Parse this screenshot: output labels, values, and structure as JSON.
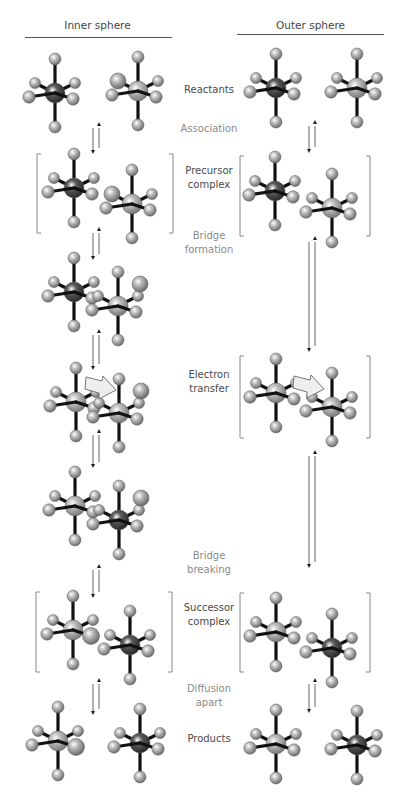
{
  "headers": {
    "inner": "Inner sphere",
    "outer": "Outer sphere"
  },
  "labels": [
    {
      "id": "reactants",
      "text": "Reactants",
      "kind": "stage",
      "x": 164,
      "y": 90
    },
    {
      "id": "association",
      "text": "Association",
      "kind": "step",
      "x": 164,
      "y": 129
    },
    {
      "id": "precursor",
      "text": "Precursor\ncomplex",
      "kind": "stage",
      "x": 164,
      "y": 178
    },
    {
      "id": "bridge-formation",
      "text": "Bridge\nformation",
      "kind": "step",
      "x": 164,
      "y": 243
    },
    {
      "id": "electron-transfer",
      "text": "Electron\ntransfer",
      "kind": "stage",
      "x": 164,
      "y": 382
    },
    {
      "id": "bridge-breaking",
      "text": "Bridge\nbreaking",
      "kind": "step",
      "x": 164,
      "y": 563
    },
    {
      "id": "successor",
      "text": "Successor\ncomplex",
      "kind": "stage",
      "x": 164,
      "y": 615
    },
    {
      "id": "diffusion-apart",
      "text": "Diffusion\napart",
      "kind": "step",
      "x": 164,
      "y": 696
    },
    {
      "id": "products",
      "text": "Products",
      "kind": "stage",
      "x": 164,
      "y": 739
    }
  ],
  "colors": {
    "bond": "#111111",
    "ligand": "#b0b0b0",
    "metal_light": "#b8b8b8",
    "metal_dark": "#4a4a4a",
    "bracket": "#888888",
    "arrow": "#555555",
    "et_arrow_fill": "#eeeeee",
    "et_arrow_stroke": "#666666"
  },
  "complexes": [
    {
      "col": "inner",
      "stage": "reactants",
      "cx": 55,
      "cy": 93,
      "metal": "dark"
    },
    {
      "col": "inner",
      "stage": "reactants",
      "cx": 138,
      "cy": 91,
      "metal": "light",
      "bridge": "left"
    },
    {
      "col": "outer",
      "stage": "reactants",
      "cx": 276,
      "cy": 88,
      "metal": "dark"
    },
    {
      "col": "outer",
      "stage": "reactants",
      "cx": 357,
      "cy": 88,
      "metal": "light"
    },
    {
      "col": "inner",
      "stage": "precursor",
      "cx": 74,
      "cy": 188,
      "metal": "dark"
    },
    {
      "col": "inner",
      "stage": "precursor",
      "cx": 132,
      "cy": 204,
      "metal": "light",
      "bridge": "left"
    },
    {
      "col": "outer",
      "stage": "precursor",
      "cx": 275,
      "cy": 191,
      "metal": "dark"
    },
    {
      "col": "outer",
      "stage": "precursor",
      "cx": 332,
      "cy": 208,
      "metal": "light"
    },
    {
      "col": "inner",
      "stage": "bridge",
      "cx": 74,
      "cy": 292,
      "metal": "dark"
    },
    {
      "col": "inner",
      "stage": "bridge",
      "cx": 118,
      "cy": 306,
      "metal": "light",
      "bridge": "upper"
    },
    {
      "col": "inner",
      "stage": "et",
      "cx": 76,
      "cy": 402,
      "metal": "light"
    },
    {
      "col": "inner",
      "stage": "et",
      "cx": 119,
      "cy": 413,
      "metal": "light",
      "bridge": "upper"
    },
    {
      "col": "outer",
      "stage": "et",
      "cx": 276,
      "cy": 393,
      "metal": "light"
    },
    {
      "col": "outer",
      "stage": "et",
      "cx": 332,
      "cy": 407,
      "metal": "light"
    },
    {
      "col": "inner",
      "stage": "post",
      "cx": 75,
      "cy": 506,
      "metal": "light"
    },
    {
      "col": "inner",
      "stage": "post",
      "cx": 119,
      "cy": 520,
      "metal": "dark",
      "bridge": "upper"
    },
    {
      "col": "inner",
      "stage": "successor",
      "cx": 73,
      "cy": 630,
      "metal": "light",
      "bridge": "right"
    },
    {
      "col": "inner",
      "stage": "successor",
      "cx": 130,
      "cy": 645,
      "metal": "dark"
    },
    {
      "col": "outer",
      "stage": "successor",
      "cx": 276,
      "cy": 632,
      "metal": "light"
    },
    {
      "col": "outer",
      "stage": "successor",
      "cx": 332,
      "cy": 648,
      "metal": "dark"
    },
    {
      "col": "inner",
      "stage": "products",
      "cx": 58,
      "cy": 741,
      "metal": "light",
      "bridge": "right"
    },
    {
      "col": "inner",
      "stage": "products",
      "cx": 140,
      "cy": 743,
      "metal": "dark"
    },
    {
      "col": "outer",
      "stage": "products",
      "cx": 276,
      "cy": 744,
      "metal": "light"
    },
    {
      "col": "outer",
      "stage": "products",
      "cx": 357,
      "cy": 745,
      "metal": "dark"
    }
  ],
  "brackets": [
    {
      "stage": "precursor",
      "x1": 37,
      "x2": 173,
      "y1": 154,
      "y2": 233
    },
    {
      "stage": "precursor",
      "x1": 240,
      "x2": 370,
      "y1": 156,
      "y2": 236
    },
    {
      "stage": "et",
      "x1": 240,
      "x2": 370,
      "y1": 356,
      "y2": 438
    },
    {
      "stage": "successor",
      "x1": 36,
      "x2": 172,
      "y1": 592,
      "y2": 672
    },
    {
      "stage": "successor",
      "x1": 240,
      "x2": 370,
      "y1": 593,
      "y2": 672
    }
  ],
  "equilibrium_arrows": [
    {
      "x": 96,
      "y1": 128,
      "y2": 154
    },
    {
      "x": 96,
      "y1": 233,
      "y2": 260
    },
    {
      "x": 96,
      "y1": 335,
      "y2": 370
    },
    {
      "x": 96,
      "y1": 435,
      "y2": 468
    },
    {
      "x": 96,
      "y1": 570,
      "y2": 598
    },
    {
      "x": 96,
      "y1": 684,
      "y2": 715
    },
    {
      "x": 312,
      "y1": 126,
      "y2": 153
    },
    {
      "x": 312,
      "y1": 242,
      "y2": 352
    },
    {
      "x": 312,
      "y1": 456,
      "y2": 568
    },
    {
      "x": 312,
      "y1": 684,
      "y2": 713
    }
  ],
  "et_arrows": [
    {
      "x": 86,
      "y": 377
    },
    {
      "x": 294,
      "y": 376
    }
  ]
}
